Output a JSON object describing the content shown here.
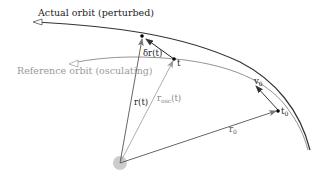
{
  "diagram": {
    "labels": {
      "actual_orbit": "Actual orbit (perturbed)",
      "reference_orbit": "Reference orbit (osculating)",
      "delta_r": "δr(t)",
      "r_t": "r(t)",
      "r_osc": "r",
      "r_osc_sub": "osc",
      "r_osc_arg": "(t)",
      "t": "t",
      "t0": "t",
      "t0_sub": "0",
      "v0": "v",
      "v0_sub": "0",
      "r0": "r",
      "r0_sub": "0"
    },
    "colors": {
      "actual_orbit": "#333333",
      "reference_orbit": "#888888",
      "central_body": "#cccccc",
      "text_dark": "#222222",
      "text_light": "#999999"
    }
  }
}
